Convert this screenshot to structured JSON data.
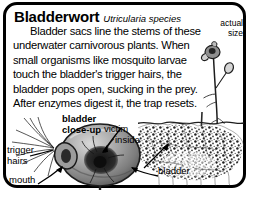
{
  "card": {
    "common_name": "Bladderwort",
    "scientific_name": "Utricularia species",
    "description": "Bladder sacs line the stems of these underwater carnivorous plants. When small organisms like mosquito larvae touch the bladder's trigger hairs, the bladder pops open, sucking in the prey. After enzymes digest it, the trap resets.",
    "actual_size_caption_line1": "actual",
    "actual_size_caption_line2": "size"
  },
  "diagram": {
    "labels": {
      "bladder_closeup_line1": "bladder",
      "bladder_closeup_line2": "close-up",
      "victim_line1": "victim",
      "victim_line2": "inside",
      "trigger_hairs_line1": "trigger",
      "trigger_hairs_line2": "hairs",
      "mouth": "mouth",
      "bladder": "bladder"
    },
    "illustrations": {
      "plant": "bladderwort-plant-actual-size",
      "underwater_mass": "underwater-plant-mass",
      "bladder_closeup": "bladder-sac-closeup",
      "water_line": "water-surface-line"
    }
  },
  "colors": {
    "frame": "#000000",
    "text": "#000000",
    "background": "#ffffff",
    "bladder_fill": "#9a9a9a",
    "bladder_dark": "#1a1a1a"
  }
}
